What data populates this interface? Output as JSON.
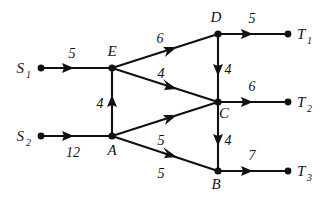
{
  "diagram": {
    "type": "directed-weighted-graph",
    "background_color": "#ffffff",
    "stroke_color": "#111111",
    "nodes": [
      {
        "id": "S1",
        "label": "S",
        "subscript": "1",
        "x": 41,
        "y": 68,
        "label_x": 24,
        "label_y": 73,
        "role": "source"
      },
      {
        "id": "S2",
        "label": "S",
        "subscript": "2",
        "x": 41,
        "y": 136,
        "label_x": 24,
        "label_y": 141,
        "role": "source"
      },
      {
        "id": "E",
        "label": "E",
        "subscript": "",
        "x": 112,
        "y": 68,
        "label_x": 108,
        "label_y": 55,
        "role": "intermediate"
      },
      {
        "id": "A",
        "label": "A",
        "subscript": "",
        "x": 112,
        "y": 136,
        "label_x": 107,
        "label_y": 155,
        "role": "intermediate"
      },
      {
        "id": "D",
        "label": "D",
        "subscript": "",
        "x": 218,
        "y": 34,
        "label_x": 212,
        "label_y": 22,
        "role": "intermediate"
      },
      {
        "id": "C",
        "label": "C",
        "subscript": "",
        "x": 218,
        "y": 102,
        "label_x": 217,
        "label_y": 119,
        "role": "intermediate"
      },
      {
        "id": "B",
        "label": "B",
        "subscript": "",
        "x": 218,
        "y": 171,
        "label_x": 212,
        "label_y": 189,
        "role": "intermediate"
      },
      {
        "id": "T1",
        "label": "T",
        "subscript": "1",
        "x": 288,
        "y": 34,
        "label_x": 298,
        "label_y": 39,
        "role": "sink"
      },
      {
        "id": "T2",
        "label": "T",
        "subscript": "2",
        "x": 288,
        "y": 102,
        "label_x": 298,
        "label_y": 107,
        "role": "sink"
      },
      {
        "id": "T3",
        "label": "T",
        "subscript": "3",
        "x": 288,
        "y": 171,
        "label_x": 298,
        "label_y": 176,
        "role": "sink"
      }
    ],
    "edges": [
      {
        "id": "S1-E",
        "from": "S1",
        "to": "E",
        "weight": "5",
        "label_x": 72,
        "label_y": 57
      },
      {
        "id": "S2-A",
        "from": "S2",
        "to": "A",
        "weight": "12",
        "label_x": 70,
        "label_y": 156
      },
      {
        "id": "A-E",
        "from": "A",
        "to": "E",
        "weight": "4",
        "label_x": 98,
        "label_y": 108
      },
      {
        "id": "E-D",
        "from": "E",
        "to": "D",
        "weight": "6",
        "label_x": 160,
        "label_y": 44
      },
      {
        "id": "E-C",
        "from": "E",
        "to": "C",
        "weight": "4",
        "label_x": 162,
        "label_y": 80
      },
      {
        "id": "A-C",
        "from": "A",
        "to": "C",
        "weight": "5",
        "label_x": 160,
        "label_y": 145
      },
      {
        "id": "A-B",
        "from": "A",
        "to": "B",
        "weight": "5",
        "label_x": 160,
        "label_y": 178
      },
      {
        "id": "D-C",
        "from": "D",
        "to": "C",
        "weight": "4",
        "label_x": 226,
        "label_y": 74
      },
      {
        "id": "C-B",
        "from": "C",
        "to": "B",
        "weight": "4",
        "label_x": 226,
        "label_y": 145
      },
      {
        "id": "D-T1",
        "from": "D",
        "to": "T1",
        "weight": "5",
        "label_x": 250,
        "label_y": 22
      },
      {
        "id": "C-T2",
        "from": "C",
        "to": "T2",
        "weight": "6",
        "label_x": 250,
        "label_y": 90
      },
      {
        "id": "B-T3",
        "from": "B",
        "to": "T3",
        "weight": "7",
        "label_x": 250,
        "label_y": 159
      }
    ]
  }
}
